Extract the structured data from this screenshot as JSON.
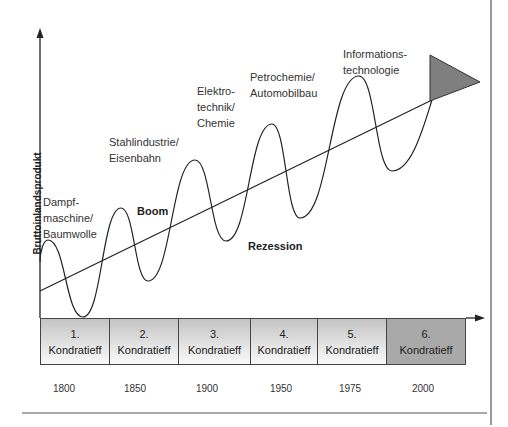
{
  "diagram": {
    "y_axis_label": "Bruttoinlandsprodukt",
    "wave_labels": {
      "boom": "Boom",
      "rezession": "Rezession"
    },
    "innovations": [
      {
        "lines": [
          "Dampf-",
          "maschine/",
          "Baumwolle"
        ]
      },
      {
        "lines": [
          "Stahlindustrie/",
          "Eisenbahn"
        ]
      },
      {
        "lines": [
          "Elektro-",
          "technik/",
          "Chemie"
        ]
      },
      {
        "lines": [
          "Petrochemie/",
          "Automobilbau"
        ]
      },
      {
        "lines": [
          "Informations-",
          "technologie"
        ]
      }
    ],
    "cycles": [
      {
        "number": "1.",
        "label": "Kondratieff",
        "year": "1800"
      },
      {
        "number": "2.",
        "label": "Kondratieff",
        "year": "1850"
      },
      {
        "number": "3.",
        "label": "Kondratieff",
        "year": "1900"
      },
      {
        "number": "4.",
        "label": "Kondratieff",
        "year": "1950"
      },
      {
        "number": "5.",
        "label": "Kondratieff",
        "year": "1975"
      },
      {
        "number": "6.",
        "label": "Kondratieff",
        "year": "2000"
      }
    ],
    "colors": {
      "line": "#222222",
      "box_gradient_top": "#c4c4c4",
      "box_gradient_bottom": "#fafafa",
      "last_box": "#a9a9a9",
      "triangle": "#7f7f7f"
    }
  }
}
